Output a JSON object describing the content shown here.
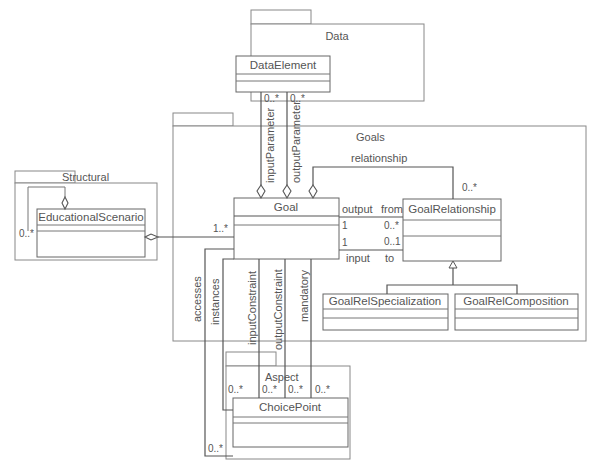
{
  "packages": {
    "data": {
      "name": "Data"
    },
    "goals": {
      "name": "Goals"
    },
    "structural": {
      "name": "Structural"
    },
    "aspect": {
      "name": "Aspect"
    }
  },
  "classes": {
    "data_element": "DataElement",
    "goal": "Goal",
    "goal_relationship": "GoalRelationship",
    "goal_rel_specialization": "GoalRelSpecialization",
    "goal_rel_composition": "GoalRelComposition",
    "educational_scenario": "EducationalScenario",
    "choice_point": "ChoicePoint"
  },
  "associations": {
    "input_parameter": {
      "role": "inputParameter",
      "mult": "0..*"
    },
    "output_parameter": {
      "role": "outputParameter",
      "mult": "0..*"
    },
    "relationship": {
      "role": "relationship",
      "mult": "0..*"
    },
    "output_from": {
      "role_goal": "output",
      "role_rel": "from",
      "mult_goal": "1",
      "mult_rel": "0..*"
    },
    "input_to": {
      "role_goal": "input",
      "role_rel": "to",
      "mult_goal": "1",
      "mult_rel": "0..1"
    },
    "scenario_goal": {
      "mult_goal": "1..*"
    },
    "scenario_self": {
      "mult": "0..*"
    },
    "accesses": {
      "role": "accesses",
      "mult": "0..*"
    },
    "instances": {
      "role": "instances",
      "mult": "0..*"
    },
    "input_constraint": {
      "role": "inputConstraint",
      "mult": "0..*"
    },
    "output_constraint": {
      "role": "outputConstraint",
      "mult": "0..*"
    },
    "mandatory": {
      "role": "mandatory",
      "mult": "0..*"
    }
  }
}
